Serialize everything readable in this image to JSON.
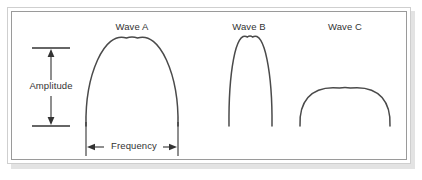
{
  "diagram": {
    "background_color": "#ffffff",
    "frame": {
      "outer_border_color": "#cfcfcf",
      "inner_border_color": "#9a9a9a",
      "shadow_color": "#e3e3e3"
    },
    "stroke_color": "#4a4a4a",
    "annotation_color": "#333333",
    "baseline_y": 126,
    "waves": [
      {
        "label": "Wave A",
        "label_x": 132,
        "label_y": 21,
        "left_x": 86,
        "right_x": 178,
        "peak_x": 132,
        "peak_y": 38,
        "width": 92,
        "height": 88,
        "shape": "tall-wide-arch",
        "relative_amplitude": "high",
        "relative_frequency": "medium"
      },
      {
        "label": "Wave B",
        "label_x": 249,
        "label_y": 21,
        "left_x": 229,
        "right_x": 272,
        "peak_x": 250,
        "peak_y": 37,
        "width": 43,
        "height": 89,
        "shape": "tall-narrow-arch",
        "relative_amplitude": "high",
        "relative_frequency": "high"
      },
      {
        "label": "Wave C",
        "label_x": 345,
        "label_y": 21,
        "left_x": 300,
        "right_x": 390,
        "peak_x": 345,
        "peak_y": 88,
        "width": 90,
        "height": 38,
        "shape": "low-wide-arch",
        "relative_amplitude": "low",
        "relative_frequency": "medium"
      }
    ],
    "amplitude_annotation": {
      "label": "Amplitude",
      "arrow_x": 51,
      "top_y": 48,
      "bottom_y": 126,
      "cap_left_x": 32,
      "cap_right_x": 70,
      "direction": "vertical-double-headed"
    },
    "frequency_annotation": {
      "label": "Frequency",
      "arrow_y": 147,
      "left_x": 86,
      "right_x": 178,
      "cap_top_y": 122,
      "cap_bottom_y": 156,
      "direction": "horizontal-double-headed"
    }
  }
}
